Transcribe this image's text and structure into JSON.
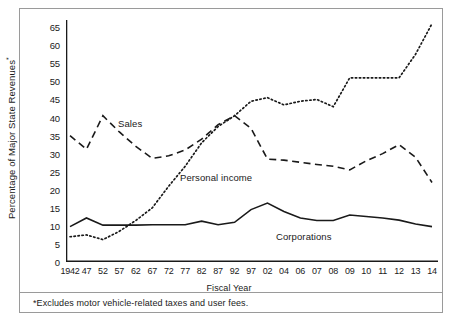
{
  "chart_data": {
    "type": "line",
    "title": "",
    "xlabel": "Fiscal Year",
    "ylabel": "Percentage of Major State Revenues*",
    "ylabel_text": "Percentage of Major State Revenues",
    "ylabel_marker": "*",
    "footnote": "*Excludes motor vehicle-related taxes and user fees.",
    "grid": false,
    "legend_position": "inline-annotations",
    "ylim": [
      0,
      67
    ],
    "yticks": [
      0,
      5,
      10,
      15,
      20,
      25,
      30,
      35,
      40,
      45,
      50,
      55,
      60,
      65
    ],
    "categories": [
      "1942",
      "47",
      "52",
      "57",
      "62",
      "67",
      "72",
      "77",
      "82",
      "87",
      "92",
      "97",
      "02",
      "04",
      "06",
      "07",
      "08",
      "09",
      "10",
      "11",
      "12",
      "13",
      "14"
    ],
    "series": [
      {
        "name": "Sales",
        "style": "dashed",
        "color": "#1a1a1a",
        "values": [
          35.0,
          31.2,
          40.5,
          36.0,
          32.0,
          28.7,
          29.4,
          31.0,
          34.0,
          38.0,
          40.5,
          37.0,
          28.5,
          28.2,
          27.6,
          27.0,
          26.5,
          25.5,
          28.0,
          30.0,
          32.5,
          29.0,
          22.0
        ]
      },
      {
        "name": "Personal income",
        "style": "dotted",
        "color": "#1a1a1a",
        "values": [
          7.0,
          7.5,
          6.2,
          8.5,
          11.5,
          15.0,
          21.0,
          26.5,
          33.0,
          37.5,
          40.5,
          44.5,
          45.5,
          43.5,
          44.5,
          45.0,
          43.0,
          51.0,
          51.0,
          51.0,
          51.0,
          57.5,
          66.0
        ]
      },
      {
        "name": "Corporations",
        "style": "solid",
        "color": "#1a1a1a",
        "values": [
          9.8,
          12.2,
          10.2,
          10.2,
          10.2,
          10.3,
          10.3,
          10.3,
          11.3,
          10.3,
          11.0,
          14.5,
          16.3,
          14.0,
          12.2,
          11.5,
          11.5,
          13.0,
          12.6,
          12.2,
          11.6,
          10.5,
          9.8
        ]
      }
    ],
    "annotations": [
      {
        "text": "Sales",
        "series": "Sales"
      },
      {
        "text": "Personal income",
        "series": "Personal income"
      },
      {
        "text": "Corporations",
        "series": "Corporations"
      }
    ]
  }
}
